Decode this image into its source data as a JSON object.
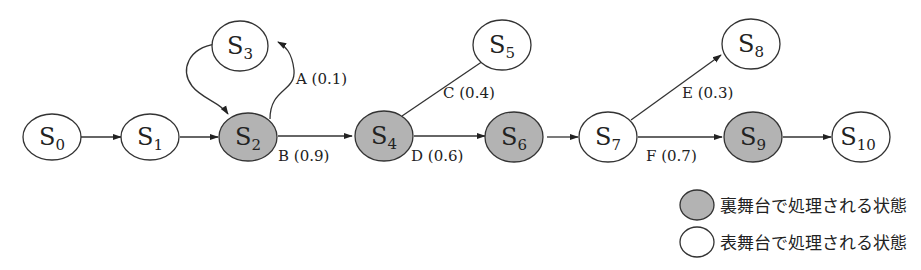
{
  "diagram": {
    "type": "state-transition",
    "colors": {
      "backstage_fill": "#b3b3b3",
      "frontstage_fill": "#ffffff",
      "stroke": "#333333"
    },
    "nodes": [
      {
        "id": "S0",
        "base": "S",
        "sub": "0",
        "kind": "frontstage"
      },
      {
        "id": "S1",
        "base": "S",
        "sub": "1",
        "kind": "frontstage"
      },
      {
        "id": "S2",
        "base": "S",
        "sub": "2",
        "kind": "backstage"
      },
      {
        "id": "S3",
        "base": "S",
        "sub": "3",
        "kind": "frontstage"
      },
      {
        "id": "S4",
        "base": "S",
        "sub": "4",
        "kind": "backstage"
      },
      {
        "id": "S5",
        "base": "S",
        "sub": "5",
        "kind": "frontstage"
      },
      {
        "id": "S6",
        "base": "S",
        "sub": "6",
        "kind": "backstage"
      },
      {
        "id": "S7",
        "base": "S",
        "sub": "7",
        "kind": "frontstage"
      },
      {
        "id": "S8",
        "base": "S",
        "sub": "8",
        "kind": "frontstage"
      },
      {
        "id": "S9",
        "base": "S",
        "sub": "9",
        "kind": "backstage"
      },
      {
        "id": "S10",
        "base": "S",
        "sub": "10",
        "kind": "frontstage"
      }
    ],
    "edges": [
      {
        "from": "S0",
        "to": "S1",
        "label": ""
      },
      {
        "from": "S1",
        "to": "S2",
        "label": ""
      },
      {
        "from": "S2",
        "to": "S3",
        "label": "A (0.1)"
      },
      {
        "from": "S3",
        "to": "S2",
        "label": ""
      },
      {
        "from": "S2",
        "to": "S4",
        "label": "B (0.9)"
      },
      {
        "from": "S4",
        "to": "S5",
        "label": "C (0.4)"
      },
      {
        "from": "S4",
        "to": "S6",
        "label": "D (0.6)"
      },
      {
        "from": "S6",
        "to": "S7",
        "label": ""
      },
      {
        "from": "S7",
        "to": "S8",
        "label": "E (0.3)"
      },
      {
        "from": "S7",
        "to": "S9",
        "label": "F (0.7)"
      },
      {
        "from": "S9",
        "to": "S10",
        "label": ""
      }
    ],
    "legend": [
      {
        "kind": "backstage",
        "label": "裏舞台で処理される状態"
      },
      {
        "kind": "frontstage",
        "label": "表舞台で処理される状態"
      }
    ]
  }
}
